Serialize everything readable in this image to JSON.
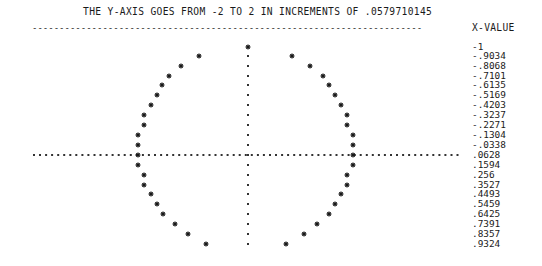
{
  "header": {
    "title": "THE Y-AXIS GOES FROM -2 TO 2 IN INCREMENTS OF .0579710145",
    "separator": "------------------------------------------------------------------------",
    "column_label": "X-VALUE"
  },
  "marker_symbol": "*",
  "x_values": [
    "-1",
    "-.9034",
    "-.8068",
    "-.7101",
    "-.6135",
    "-.5169",
    "-.4203",
    "-.3237",
    "-.2271",
    "-.1304",
    "-.0338",
    ".0628",
    ".1594",
    ".256",
    ".3527",
    ".4493",
    ".5459",
    ".6425",
    ".7391",
    ".8357",
    ".9324"
  ],
  "chart_data": {
    "type": "scatter",
    "title": "THE Y-AXIS GOES FROM -2 TO 2 IN INCREMENTS OF .0579710145",
    "xlabel": "X-VALUE",
    "ylabel": "Y",
    "orientation": "rotated text plot: x runs down rows, y runs across columns",
    "y_range": [
      -2,
      2
    ],
    "y_increment": 0.0579710145,
    "x_values": [
      -1,
      -0.9034,
      -0.8068,
      -0.7101,
      -0.6135,
      -0.5169,
      -0.4203,
      -0.3237,
      -0.2271,
      -0.1304,
      -0.0338,
      0.0628,
      0.1594,
      0.256,
      0.3527,
      0.4493,
      0.5459,
      0.6425,
      0.7391,
      0.8357,
      0.9324
    ],
    "series": [
      {
        "name": "lower branch (negative y)",
        "values": [
          0.0,
          -0.43,
          -0.59,
          -0.7,
          -0.79,
          -0.86,
          -0.91,
          -0.95,
          -0.97,
          -0.99,
          -1.0,
          -1.0,
          -0.99,
          -0.97,
          -0.94,
          -0.89,
          -0.84,
          -0.77,
          -0.67,
          -0.55,
          -0.36
        ]
      },
      {
        "name": "upper branch (positive y)",
        "values": [
          0.0,
          0.43,
          0.59,
          0.7,
          0.79,
          0.86,
          0.91,
          0.95,
          0.97,
          0.99,
          1.0,
          1.0,
          0.99,
          0.97,
          0.94,
          0.89,
          0.84,
          0.77,
          0.67,
          0.55,
          0.36
        ]
      }
    ],
    "grid": false,
    "legend": "none"
  },
  "plot": {
    "row_y": [
      47,
      56,
      66,
      76,
      85,
      95,
      105,
      115,
      125,
      135,
      145,
      155,
      165,
      175,
      185,
      194,
      204,
      214,
      224,
      234,
      244
    ],
    "left_x": [
      248,
      199,
      181,
      169,
      162,
      157,
      151,
      144,
      144,
      138,
      138,
      138,
      138,
      144,
      144,
      151,
      157,
      163,
      175,
      188,
      206
    ],
    "right_x": [
      248,
      292,
      310,
      323,
      329,
      335,
      341,
      347,
      347,
      353,
      353,
      353,
      353,
      347,
      347,
      341,
      335,
      329,
      317,
      304,
      286
    ],
    "axis_x": 248,
    "axis_y": 155,
    "h_axis_from": 33,
    "h_axis_to": 458,
    "marker_color": "#1a1a1a",
    "axis_color": "#333333"
  }
}
